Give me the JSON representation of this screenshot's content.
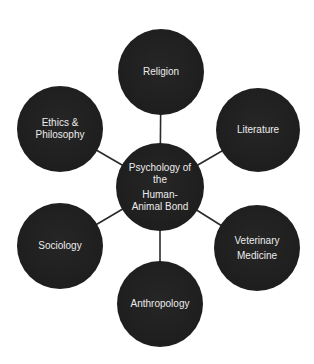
{
  "diagram": {
    "colors": {
      "background": "#ffffff",
      "node_fill": "#222222",
      "node_text": "#ececec",
      "connector": "#2a2a2a"
    },
    "center": {
      "id": "psychology",
      "lines": [
        "Psychology of",
        "the"
      ],
      "lines2": [
        "Human-",
        "Animal Bond"
      ],
      "cx": 160,
      "cy": 187,
      "r": 44
    },
    "nodes": [
      {
        "id": "religion",
        "lines": [
          "Religion"
        ],
        "cx": 161,
        "cy": 72,
        "r": 43
      },
      {
        "id": "literature",
        "lines": [
          "Literature"
        ],
        "cx": 258,
        "cy": 130,
        "r": 42
      },
      {
        "id": "veterinary",
        "lines": [
          "Veterinary",
          "Medicine"
        ],
        "cx": 257,
        "cy": 248,
        "r": 43
      },
      {
        "id": "anthropology",
        "lines": [
          "Anthropology"
        ],
        "cx": 160,
        "cy": 304,
        "r": 43
      },
      {
        "id": "sociology",
        "lines": [
          "Sociology"
        ],
        "cx": 60,
        "cy": 246,
        "r": 43
      },
      {
        "id": "ethics",
        "lines": [
          "Ethics &",
          "Philosophy"
        ],
        "cx": 60,
        "cy": 129,
        "r": 43
      }
    ],
    "edges": [
      {
        "from": "psychology",
        "to": "religion"
      },
      {
        "from": "psychology",
        "to": "literature"
      },
      {
        "from": "psychology",
        "to": "veterinary"
      },
      {
        "from": "psychology",
        "to": "anthropology"
      },
      {
        "from": "psychology",
        "to": "sociology"
      },
      {
        "from": "psychology",
        "to": "ethics"
      }
    ]
  }
}
